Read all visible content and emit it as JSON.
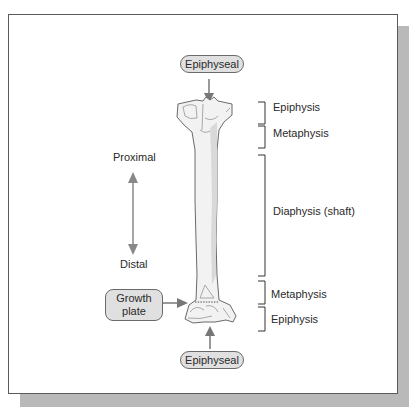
{
  "diagram": {
    "type": "long-bone-anatomy",
    "top_label": "Epiphyseal",
    "bottom_label": "Epiphyseal",
    "growth_plate_label": [
      "Growth",
      "plate"
    ],
    "orientation": {
      "proximal": "Proximal",
      "distal": "Distal"
    },
    "regions": [
      {
        "name": "Epiphysis"
      },
      {
        "name": "Metaphysis"
      },
      {
        "name": "Diaphysis (shaft)"
      },
      {
        "name": "Metaphysis"
      },
      {
        "name": "Epiphysis"
      }
    ],
    "colors": {
      "frame_border": "#5a5a5a",
      "shadow": "#b9b9b9",
      "pill_fill": "#e0e0e0",
      "arrow": "#777777",
      "bone_fill": "#f2f2f2",
      "bone_shade": "#d9d9d9"
    }
  }
}
